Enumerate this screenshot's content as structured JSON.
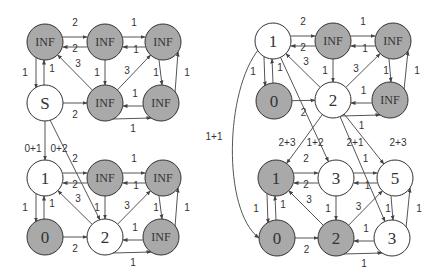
{
  "colors": {
    "visited_fill": "#a9a9a9",
    "unvisited_fill": "#ffffff",
    "stroke": "#333333",
    "edge": "#555555"
  },
  "graphs": [
    {
      "name": "left-top",
      "nodes": [
        {
          "id": "a",
          "label": "INF",
          "x": 45,
          "y": 42,
          "filled": true
        },
        {
          "id": "b",
          "label": "INF",
          "x": 105,
          "y": 42,
          "filled": true
        },
        {
          "id": "c",
          "label": "INF",
          "x": 163,
          "y": 42,
          "filled": true
        },
        {
          "id": "s",
          "label": "S",
          "x": 45,
          "y": 103,
          "filled": false
        },
        {
          "id": "d",
          "label": "INF",
          "x": 105,
          "y": 103,
          "filled": true
        },
        {
          "id": "e",
          "label": "INF",
          "x": 161,
          "y": 103,
          "filled": true
        }
      ]
    },
    {
      "name": "left-bottom",
      "nodes": [
        {
          "id": "a",
          "label": "1",
          "x": 45,
          "y": 178,
          "filled": false
        },
        {
          "id": "b",
          "label": "INF",
          "x": 105,
          "y": 178,
          "filled": true
        },
        {
          "id": "c",
          "label": "INF",
          "x": 163,
          "y": 178,
          "filled": true
        },
        {
          "id": "s",
          "label": "0",
          "x": 45,
          "y": 237,
          "filled": true
        },
        {
          "id": "d",
          "label": "2",
          "x": 105,
          "y": 237,
          "filled": false
        },
        {
          "id": "e",
          "label": "INF",
          "x": 161,
          "y": 237,
          "filled": true
        }
      ]
    },
    {
      "name": "right-top",
      "nodes": [
        {
          "id": "a",
          "label": "1",
          "x": 273,
          "y": 41,
          "filled": false
        },
        {
          "id": "b",
          "label": "INF",
          "x": 333,
          "y": 41,
          "filled": true
        },
        {
          "id": "c",
          "label": "INF",
          "x": 393,
          "y": 41,
          "filled": true
        },
        {
          "id": "s",
          "label": "0",
          "x": 274,
          "y": 101,
          "filled": true
        },
        {
          "id": "d",
          "label": "2",
          "x": 333,
          "y": 100,
          "filled": false
        },
        {
          "id": "e",
          "label": "INF",
          "x": 390,
          "y": 100,
          "filled": true
        }
      ]
    },
    {
      "name": "right-bottom",
      "nodes": [
        {
          "id": "a",
          "label": "1",
          "x": 276,
          "y": 178,
          "filled": true
        },
        {
          "id": "b",
          "label": "3",
          "x": 336,
          "y": 178,
          "filled": false
        },
        {
          "id": "c",
          "label": "5",
          "x": 395,
          "y": 178,
          "filled": false
        },
        {
          "id": "s",
          "label": "0",
          "x": 277,
          "y": 238,
          "filled": true
        },
        {
          "id": "d",
          "label": "2",
          "x": 336,
          "y": 238,
          "filled": true
        },
        {
          "id": "e",
          "label": "3",
          "x": 392,
          "y": 238,
          "filled": false
        }
      ]
    }
  ],
  "edge_weights": {
    "top_back": "2",
    "top_fwd": "2",
    "top_right_back": "1",
    "top_right_fwd": "1",
    "left_down": "1",
    "left_up": "1",
    "diag_left": "3",
    "mid_down": "1",
    "diag_right": "3",
    "right_down": "1",
    "right_up": "1",
    "bottom_fwd": "2",
    "bottom_right_back": "1",
    "bottom_right_fwd": "1"
  },
  "connectors": {
    "left_0p1": "0+1",
    "left_0p2": "0+2",
    "right_1p1": "1+1",
    "right_2p3_left": "2+3",
    "right_1p2": "1+2",
    "right_2p1": "2+1",
    "right_2p3_right": "2+3"
  }
}
